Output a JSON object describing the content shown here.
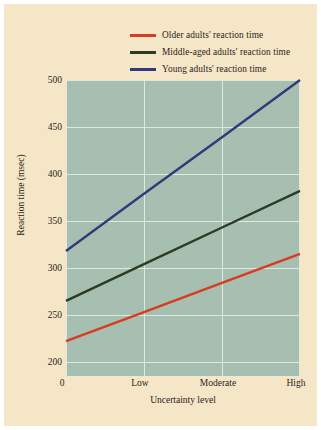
{
  "figure": {
    "background_color": "#f6e6c8",
    "plot_background_color": "#a6bfb0",
    "grid_color": "#e8eee6"
  },
  "chart_data": {
    "type": "line",
    "title": "",
    "xlabel": "Uncertainty level",
    "ylabel": "Reaction time (msec)",
    "x": [
      0,
      1,
      2,
      3
    ],
    "categories": [
      "0",
      "Low",
      "Moderate",
      "High"
    ],
    "xtick_labels": [
      "0",
      "Low",
      "Moderate",
      "High"
    ],
    "ytick_labels": [
      "200",
      "250",
      "300",
      "350",
      "400",
      "450",
      "500"
    ],
    "yticks": [
      200,
      250,
      300,
      350,
      400,
      450,
      500
    ],
    "ylim": [
      185,
      500
    ],
    "xlim": [
      0,
      3
    ],
    "grid": true,
    "legend_position": "top-right",
    "series": [
      {
        "name": "Older adults' reaction time",
        "color": "#d93b22",
        "values": [
          222,
          253,
          284,
          315
        ]
      },
      {
        "name": "Middle-aged adults' reaction time",
        "color": "#2d3a24",
        "values": [
          265,
          304,
          343,
          382
        ]
      },
      {
        "name": "Young adults' reaction time",
        "color": "#313a7a",
        "values": [
          318,
          379,
          439,
          500
        ]
      }
    ]
  },
  "legend": {
    "items": [
      {
        "label": "Older adults' reaction time",
        "color": "#d93b22"
      },
      {
        "label": "Middle-aged adults' reaction time",
        "color": "#2d3a24"
      },
      {
        "label": "Young adults' reaction time",
        "color": "#313a7a"
      }
    ]
  }
}
